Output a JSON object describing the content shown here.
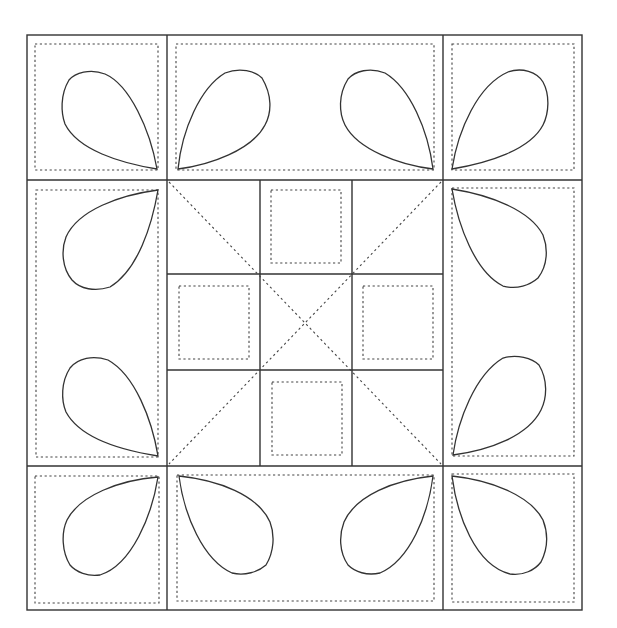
{
  "diagram": {
    "type": "quilt-block-pattern",
    "width": 617,
    "height": 628,
    "colors": {
      "background": "#ffffff",
      "line": "#333333",
      "dotted": "#444444"
    },
    "outer": {
      "x1": 27,
      "y1": 35,
      "x2": 582,
      "y2": 610
    },
    "columns": [
      27,
      167,
      443,
      582
    ],
    "rows": [
      35,
      180,
      466,
      610
    ],
    "center_grid": {
      "xs": [
        167,
        260,
        352,
        443
      ],
      "ys": [
        180,
        274,
        370,
        466
      ]
    },
    "regions": [
      {
        "name": "corner-top-left",
        "petals": 1
      },
      {
        "name": "border-top",
        "petals": 2
      },
      {
        "name": "corner-top-right",
        "petals": 1
      },
      {
        "name": "border-left",
        "petals": 2
      },
      {
        "name": "center-nine-patch",
        "petals": 0
      },
      {
        "name": "border-right",
        "petals": 2
      },
      {
        "name": "corner-bottom-left",
        "petals": 1
      },
      {
        "name": "border-bottom",
        "petals": 2
      },
      {
        "name": "corner-bottom-right",
        "petals": 1
      }
    ],
    "petal_count": 12,
    "line_styles": [
      "solid seam lines",
      "dotted stitching lines",
      "dotted diagonal lines"
    ]
  }
}
